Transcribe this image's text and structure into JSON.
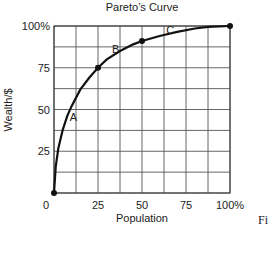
{
  "chart_data": {
    "type": "line",
    "title": "Pareto’s Curve",
    "xlabel": "Population",
    "ylabel": "Wealth/$",
    "xlim": [
      0,
      100
    ],
    "ylim": [
      0,
      100
    ],
    "grid": true,
    "grid_step": 12.5,
    "x_ticks": [
      {
        "value": 0,
        "label": "0"
      },
      {
        "value": 25,
        "label": "25"
      },
      {
        "value": 50,
        "label": "50"
      },
      {
        "value": 75,
        "label": "75"
      },
      {
        "value": 100,
        "label": "100%"
      }
    ],
    "y_ticks": [
      {
        "value": 25,
        "label": "25"
      },
      {
        "value": 50,
        "label": "50"
      },
      {
        "value": 75,
        "label": "75"
      },
      {
        "value": 100,
        "label": "100%"
      }
    ],
    "series": [
      {
        "name": "Pareto curve",
        "color": "#111111",
        "x": [
          0,
          1,
          2.5,
          5,
          7.5,
          10,
          12.5,
          15,
          20,
          25,
          30,
          37.5,
          45,
          50,
          60,
          70,
          80,
          87.5,
          100
        ],
        "y": [
          0,
          16,
          27,
          38,
          46,
          52,
          57,
          62,
          69,
          75,
          80,
          85,
          89,
          91,
          94,
          96.5,
          98.5,
          99.5,
          100
        ]
      }
    ],
    "markers": [
      {
        "x": 0,
        "y": 0
      },
      {
        "x": 25,
        "y": 75
      },
      {
        "x": 50,
        "y": 91
      },
      {
        "x": 100,
        "y": 100
      }
    ],
    "annotations": [
      {
        "text": "A",
        "x": 11,
        "y": 43
      },
      {
        "text": "B",
        "x": 35,
        "y": 84
      },
      {
        "text": "C",
        "x": 66,
        "y": 95
      }
    ]
  },
  "caption_fragment": "Fi"
}
